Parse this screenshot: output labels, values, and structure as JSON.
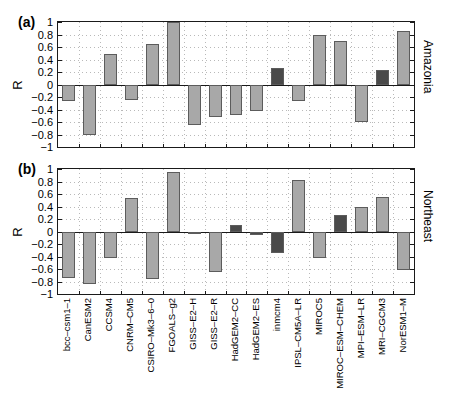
{
  "figure": {
    "panel_a_label": "(a)",
    "panel_b_label": "(b)",
    "y_axis_title_a": "R",
    "y_axis_title_b": "R",
    "region_a": "Amazonia",
    "region_b": "Northeast"
  },
  "chart_data": {
    "type": "bar",
    "title": "",
    "xlabel": "",
    "ylabel": "R",
    "ylim": [
      -1,
      1
    ],
    "yticks": [
      1,
      0.8,
      0.6,
      0.4,
      0.2,
      0,
      -0.2,
      -0.4,
      -0.6,
      -0.8,
      -1
    ],
    "ytick_labels": [
      "1",
      "0.8",
      "0.6",
      "0.4",
      "0.2",
      "0",
      "-0.2",
      "-0.4",
      "-0.6",
      "-0.8",
      "-1"
    ],
    "grid": true,
    "legend": "none",
    "bar_color_light": "#a8a8a8",
    "bar_color_dark": "#4a4a4a",
    "bar_edge_color": "#5c5c5c",
    "categories": [
      "bcc-csm1-1",
      "CanESM2",
      "CCSM4",
      "CNRM-CM5",
      "CSIRO-Mk3-6-0",
      "FGOALS-g2",
      "GISS-E2-H",
      "GISS-E2-R",
      "HadGEM2-CC",
      "HadGEM2-ES",
      "inmcm4",
      "IPSL-CM5A-LR",
      "MIROC5",
      "MIROC-ESM-CHEM",
      "MPI-ESM-LR",
      "MRI-CGCM3",
      "NorESM1-M"
    ],
    "panels": [
      {
        "key": "a",
        "label": "(a)",
        "region": "Amazonia",
        "values": [
          -0.27,
          -0.8,
          0.49,
          -0.24,
          0.65,
          1.0,
          -0.65,
          -0.52,
          -0.48,
          -0.42,
          0.27,
          -0.27,
          0.79,
          0.69,
          -0.6,
          0.23,
          0.85
        ],
        "shades": [
          "light",
          "light",
          "light",
          "light",
          "light",
          "light",
          "light",
          "light",
          "light",
          "light",
          "dark",
          "light",
          "light",
          "light",
          "light",
          "dark",
          "light"
        ]
      },
      {
        "key": "b",
        "label": "(b)",
        "region": "Northeast",
        "values": [
          -0.74,
          -0.84,
          -0.43,
          0.54,
          -0.76,
          0.96,
          -0.02,
          -0.64,
          0.1,
          -0.06,
          -0.34,
          0.83,
          -0.43,
          0.27,
          0.39,
          0.56,
          -0.61
        ],
        "shades": [
          "light",
          "light",
          "light",
          "light",
          "light",
          "light",
          "dark",
          "light",
          "dark",
          "dark",
          "dark",
          "light",
          "light",
          "dark",
          "light",
          "light",
          "light"
        ]
      }
    ]
  }
}
